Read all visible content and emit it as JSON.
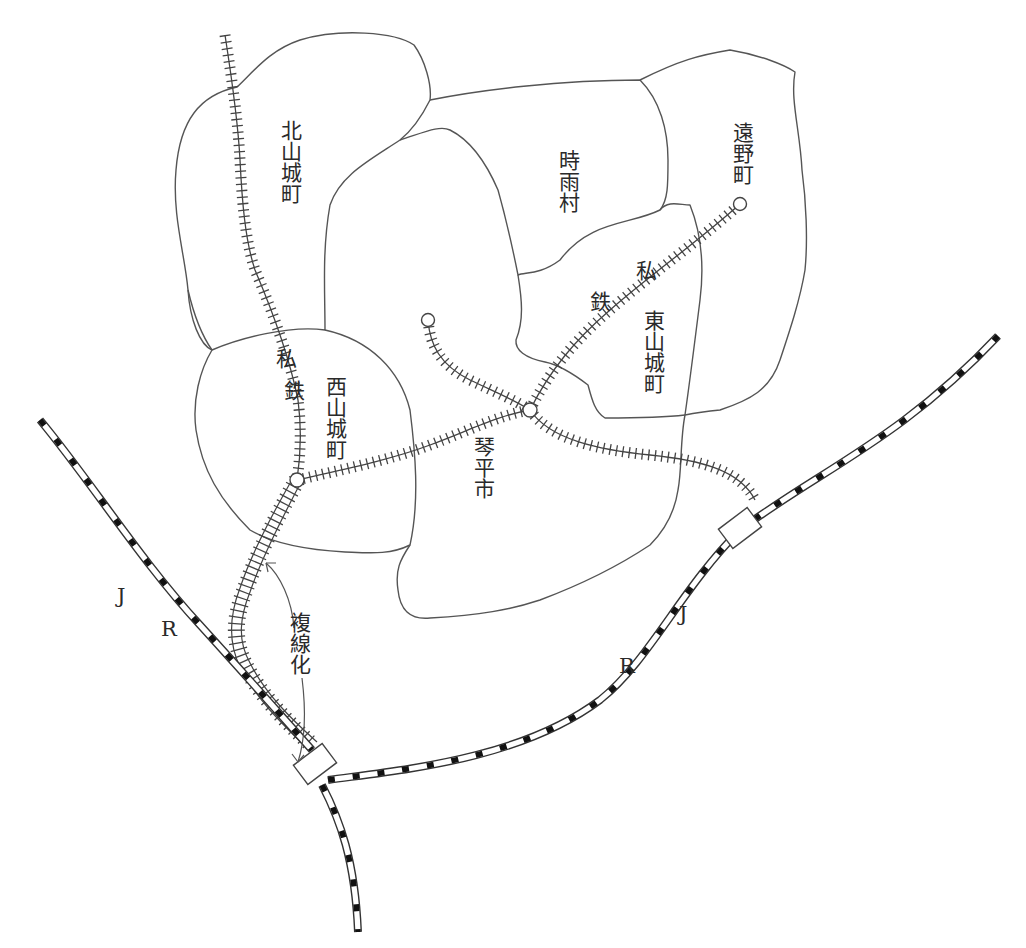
{
  "figure": {
    "type": "railway-map",
    "cropped_top_text": "…"
  },
  "regions": [
    {
      "id": "kitayamashiro",
      "label": "北山城町"
    },
    {
      "id": "shigure",
      "label": "時雨村"
    },
    {
      "id": "tono",
      "label": "遠野町"
    },
    {
      "id": "higashiyamashiro",
      "label": "東山城町"
    },
    {
      "id": "nishiyamashiro",
      "label": "西山城町"
    },
    {
      "id": "kotohira",
      "label": "琴平市"
    }
  ],
  "railways": {
    "private": {
      "label_1": "私",
      "label_2": "鉄",
      "label_a1": "私",
      "label_a2": "鉄"
    },
    "jr_west": {
      "label_j": "J",
      "label_r": "R"
    },
    "jr_east": {
      "label_j": "J",
      "label_r": "R"
    }
  },
  "annotations": {
    "double_track": "複線化"
  },
  "legend": {
    "private_railway_symbol": "single track with cross ties",
    "jr_symbol": "dashed black-and-white line",
    "station_symbol": "circle",
    "jr_junction_symbol": "rectangle"
  },
  "colors": {
    "line": "#444444",
    "background": "#ffffff",
    "text": "#2a2a2a"
  }
}
